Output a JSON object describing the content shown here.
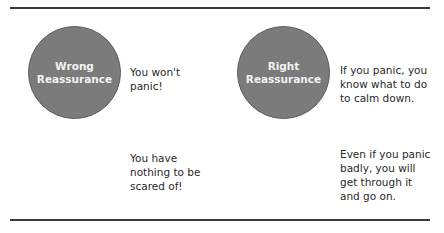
{
  "colors": {
    "circle_fill": "#7b7b7b",
    "circle_text": "#f2f2f2",
    "rule": "#3a3a3a",
    "body_text": "#2a2a2a"
  },
  "wrong": {
    "title_line1": "Wrong",
    "title_line2": "Reassurance",
    "statements": [
      {
        "text": "You won't panic!"
      },
      {
        "text": "You have nothing to be scared of!"
      }
    ]
  },
  "right": {
    "title_line1": "Right",
    "title_line2": "Reassurance",
    "statements": [
      {
        "text": "If you panic, you know what to do to calm down."
      },
      {
        "text": "Even if you panic badly, you will get through it and go on."
      }
    ]
  }
}
